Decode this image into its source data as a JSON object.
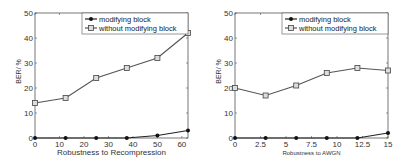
{
  "chart_data": [
    {
      "type": "line",
      "title": "",
      "xlabel": "Robustness to Recompression",
      "ylabel": "BER/ %",
      "x": [
        0,
        12.5,
        25,
        37.5,
        50,
        62.5
      ],
      "xticks": [
        0,
        10,
        20,
        30,
        40,
        50,
        60
      ],
      "yticks": [
        0,
        10,
        20,
        30,
        40,
        50
      ],
      "xlim": [
        0,
        62.5
      ],
      "ylim": [
        0,
        50
      ],
      "grid": false,
      "legend_position": "upper right",
      "series": [
        {
          "name": "modifying block",
          "marker": "filled-circle",
          "values": [
            0,
            0,
            0,
            0,
            1,
            3
          ]
        },
        {
          "name": "without modifying block",
          "marker": "square",
          "values": [
            14,
            16,
            24,
            28,
            32,
            42
          ]
        }
      ]
    },
    {
      "type": "line",
      "title": "",
      "xlabel": "Robustness to AWGN",
      "ylabel": "BER/ %",
      "x": [
        0,
        3,
        6,
        9,
        12,
        15
      ],
      "xticks": [
        0,
        2.5,
        5,
        7.5,
        10,
        12.5,
        15
      ],
      "yticks": [
        0,
        10,
        20,
        30,
        40,
        50
      ],
      "xlim": [
        0,
        15
      ],
      "ylim": [
        0,
        50
      ],
      "grid": false,
      "legend_position": "upper right",
      "series": [
        {
          "name": "modifying block",
          "marker": "filled-circle",
          "values": [
            0,
            0,
            0,
            0,
            0,
            2
          ]
        },
        {
          "name": "without modifying block",
          "marker": "square",
          "values": [
            20,
            17,
            21,
            26,
            28,
            27
          ]
        }
      ]
    }
  ],
  "charts": {
    "left": {
      "xlabel": "Robustness to Recompression",
      "ylabel": "BER/ %",
      "legend": [
        "modifying block",
        "without modifying block"
      ]
    },
    "right": {
      "xlabel": "Robustness to AWGN",
      "ylabel": "BER/ %",
      "legend": [
        "modifying block",
        "without modifying block"
      ]
    }
  }
}
